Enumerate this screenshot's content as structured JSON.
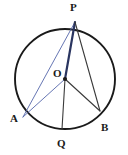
{
  "figure": {
    "background_color": "#ffffff",
    "stroke_color_dark": "#1a1a1a",
    "stroke_color_blue": "#5566aa",
    "width": 128,
    "height": 155
  },
  "circle": {
    "name": "main-circle",
    "center_x": 65,
    "center_y": 79,
    "radius": 50,
    "stroke_color": "#1a1a1a",
    "stroke_width": 1.9,
    "fill": "none"
  },
  "points": {
    "P": {
      "label": "P",
      "x": 75,
      "y": 22,
      "on_circle": true,
      "label_x": 70,
      "label_y": 2
    },
    "O": {
      "label": "O",
      "x": 65,
      "y": 79,
      "on_circle": false,
      "label_x": 53,
      "label_y": 68
    },
    "A": {
      "label": "A",
      "x": 23,
      "y": 117,
      "on_circle": true,
      "label_x": 10,
      "label_y": 113
    },
    "B": {
      "label": "B",
      "x": 100,
      "y": 111,
      "on_circle": true,
      "label_x": 101,
      "label_y": 122
    },
    "Q": {
      "label": "Q",
      "x": 62,
      "y": 129,
      "on_circle": true,
      "label_x": 57,
      "label_y": 138
    }
  },
  "segments": [
    {
      "name": "segment-A-P",
      "from": "A",
      "to": "P",
      "color": "#5566aa",
      "width": 0.9
    },
    {
      "name": "segment-A-O",
      "from": "A",
      "to": "O",
      "color": "#5566aa",
      "width": 0.9
    },
    {
      "name": "segment-O-P",
      "from": "O",
      "to": "P",
      "color": "#2a3560",
      "width": 2.2
    },
    {
      "name": "segment-P-B",
      "from": "P",
      "to": "B",
      "color": "#3a3a3a",
      "width": 1.1
    },
    {
      "name": "segment-O-B",
      "from": "O",
      "to": "B",
      "color": "#3a3a3a",
      "width": 1.1
    },
    {
      "name": "segment-O-Q",
      "from": "O",
      "to": "Q",
      "color": "#3a3a3a",
      "width": 1.1
    }
  ],
  "center_dot": {
    "name": "center-point-marker",
    "x": 65,
    "y": 79,
    "radius": 2.1,
    "color": "#1a1a1a"
  }
}
